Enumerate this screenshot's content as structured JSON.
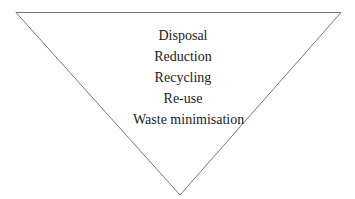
{
  "diagram": {
    "shape": "inverted-triangle",
    "stroke_color": "#777777",
    "levels": [
      {
        "label": "Disposal"
      },
      {
        "label": "Reduction"
      },
      {
        "label": "Recycling"
      },
      {
        "label": "Re-use"
      },
      {
        "label": "Waste minimisation"
      }
    ]
  }
}
